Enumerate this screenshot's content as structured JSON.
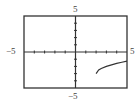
{
  "chart_data": {
    "type": "line",
    "title": "",
    "xlabel": "",
    "ylabel": "",
    "xlim": [
      -5,
      5
    ],
    "ylim": [
      -5,
      5
    ],
    "grid": false,
    "tick_step": 1,
    "labels": {
      "x_min": "−5",
      "x_max": "5",
      "y_min": "−5",
      "y_max": "5"
    },
    "series": [
      {
        "name": "y = √(x − 2) − 3",
        "x": [
          2,
          2.25,
          2.5,
          3,
          3.5,
          4,
          4.5,
          5
        ],
        "y": [
          -3,
          -2.5,
          -2.29,
          -2,
          -1.78,
          -1.59,
          -1.42,
          -1.27
        ]
      }
    ]
  },
  "colors": {
    "frame": "#333333",
    "axes": "#333333",
    "curve": "#333333",
    "background": "#ffffff"
  }
}
